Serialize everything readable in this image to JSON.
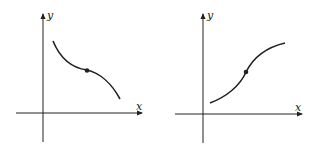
{
  "graphs": [
    {
      "name": "decreasing-graph",
      "axes": {
        "x_label": "x",
        "y_label": "y"
      },
      "curve": "decreasing, concave up then concave down, with inflection point marked"
    },
    {
      "name": "increasing-graph",
      "axes": {
        "x_label": "x",
        "y_label": "y"
      },
      "curve": "increasing, concave up then concave down, with inflection point marked"
    }
  ],
  "colors": {
    "stroke": "#222222",
    "background": "#ffffff"
  }
}
